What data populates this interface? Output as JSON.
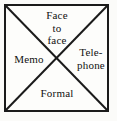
{
  "figure": {
    "shape": "square-with-diagonals",
    "line_color": "#1b1b1b",
    "background_color": "#fdfdfb",
    "text_color": "#111111"
  },
  "quadrants": [
    {
      "position": "top",
      "label": "Face\nto\nface",
      "lines": [
        "Face",
        "to",
        "face"
      ]
    },
    {
      "position": "right",
      "label": "Tele-\nphone",
      "lines": [
        "Tele-",
        "phone"
      ]
    },
    {
      "position": "bottom",
      "label": "Formal",
      "lines": [
        "Formal"
      ]
    },
    {
      "position": "left",
      "label": "Memo",
      "lines": [
        "Memo"
      ]
    }
  ],
  "geometry": {
    "square": {
      "x": 4,
      "y": 4,
      "width": 105,
      "height": 108
    },
    "center": {
      "x": 57,
      "y": 58
    }
  }
}
